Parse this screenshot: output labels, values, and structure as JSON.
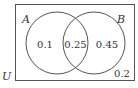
{
  "diagram": {
    "type": "venn",
    "universe": {
      "label": "U",
      "outside_value": "0.2"
    },
    "sets": [
      {
        "label": "A",
        "only_value": "0.1"
      },
      {
        "label": "B",
        "only_value": "0.45"
      }
    ],
    "intersection_value": "0.25",
    "colors": {
      "stroke": "#555555",
      "text": "#333333",
      "background": "#ffffff"
    }
  }
}
